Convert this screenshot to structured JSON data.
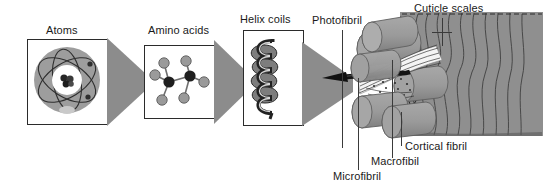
{
  "figure": {
    "title_visible": false,
    "background_color": "#ffffff",
    "panel_border_color": "#2b2b2b",
    "funnel_color": "#8c8c8c",
    "cylinder_color": "#9a9a9a",
    "cuticle_color": "#8f8f8f",
    "text_color": "#1a1a1a"
  },
  "panels": [
    {
      "id": "atoms",
      "label": "Atoms",
      "icon": "atom-orbit-icon"
    },
    {
      "id": "amino-acids",
      "label": "Amino acids",
      "icon": "molecule-ball-stick-icon"
    },
    {
      "id": "helix-coils",
      "label": "Helix coils",
      "icon": "alpha-helix-coil-icon"
    }
  ],
  "connectors": [
    {
      "id": "funnel-atoms-to-amino",
      "icon": "funnel-triangle-icon"
    },
    {
      "id": "funnel-amino-to-helix",
      "icon": "funnel-triangle-icon"
    },
    {
      "id": "funnel-helix-to-fiber",
      "icon": "funnel-triangle-icon"
    }
  ],
  "fiber_labels": [
    {
      "id": "photofibril",
      "label": "Photofibril"
    },
    {
      "id": "cuticle-scales",
      "label": "Cuticle scales"
    },
    {
      "id": "cortical-fibril",
      "label": "Cortical fibril"
    },
    {
      "id": "macrofibil",
      "label": "Macrofibil"
    },
    {
      "id": "microfibril",
      "label": "Microfibril"
    }
  ]
}
